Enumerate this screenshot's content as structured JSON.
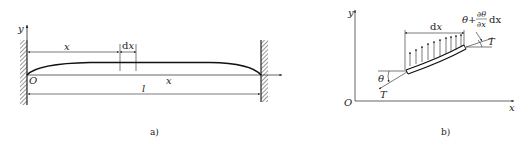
{
  "figure_a": {
    "caption": "a)",
    "axis_y": "y",
    "axis_x": "x",
    "origin": "O",
    "dim_x": "x",
    "dim_dx": "dx",
    "dim_l": "l"
  },
  "figure_b": {
    "caption": "b)",
    "axis_y": "y",
    "axis_x": "x",
    "origin": "O",
    "dim_dx": "dx",
    "angle_left": "θ",
    "angle_right_theta": "θ+",
    "angle_right_num": "∂θ",
    "angle_right_den": "∂x",
    "angle_right_dx": "dx",
    "tension_left": "T",
    "tension_right": "T"
  },
  "colors": {
    "line": "#222222",
    "hatch": "#333333",
    "background": "#ffffff"
  }
}
